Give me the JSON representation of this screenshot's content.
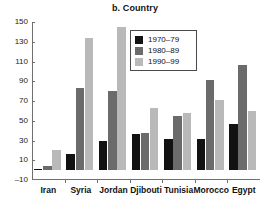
{
  "chart_data": {
    "type": "bar",
    "title": "b. Country",
    "xlabel": "",
    "ylabel": "",
    "ylim": [
      -10,
      150
    ],
    "yticks": [
      -10,
      10,
      30,
      50,
      70,
      90,
      110,
      130,
      150
    ],
    "grid": false,
    "legend_position": "upper right",
    "categories": [
      "Iran",
      "Syria",
      "Jordan",
      "Djibouti",
      "Tunisia",
      "Morocco",
      "Egypt"
    ],
    "series": [
      {
        "name": "1970–79",
        "color": "#121212",
        "values": [
          1,
          16,
          30,
          37,
          32,
          32,
          47
        ]
      },
      {
        "name": "1980–89",
        "color": "#6b6b6b",
        "values": [
          4,
          83,
          80,
          38,
          55,
          91,
          106
        ]
      },
      {
        "name": "1990–99",
        "color": "#b9b9b9",
        "values": [
          20,
          134,
          145,
          63,
          58,
          71,
          60
        ]
      }
    ]
  },
  "axis": {
    "y_tick_labels": [
      "150",
      "130",
      "110",
      "90",
      "70",
      "50",
      "30",
      "10",
      "–10"
    ]
  }
}
